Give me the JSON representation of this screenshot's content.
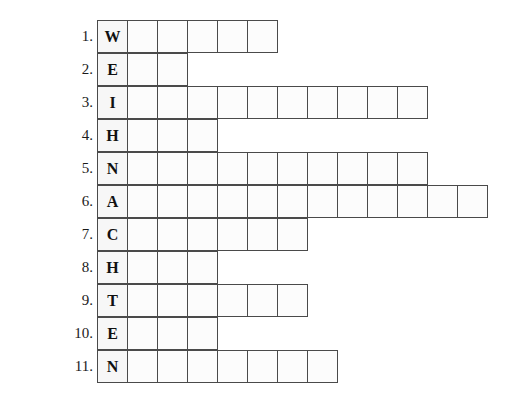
{
  "puzzle": {
    "title": "WEIHNACHTEN word puzzle grid",
    "cell_background": "#fbfbfb",
    "border_color": "#4a4a4a",
    "rows": [
      {
        "number": "1.",
        "letter": "W",
        "cells": 6
      },
      {
        "number": "2.",
        "letter": "E",
        "cells": 3
      },
      {
        "number": "3.",
        "letter": "I",
        "cells": 11
      },
      {
        "number": "4.",
        "letter": "H",
        "cells": 4
      },
      {
        "number": "5.",
        "letter": "N",
        "cells": 11
      },
      {
        "number": "6.",
        "letter": "A",
        "cells": 13
      },
      {
        "number": "7.",
        "letter": "C",
        "cells": 7
      },
      {
        "number": "8.",
        "letter": "H",
        "cells": 4
      },
      {
        "number": "9.",
        "letter": "T",
        "cells": 7
      },
      {
        "number": "10.",
        "letter": "E",
        "cells": 4
      },
      {
        "number": "11.",
        "letter": "N",
        "cells": 8
      }
    ]
  }
}
